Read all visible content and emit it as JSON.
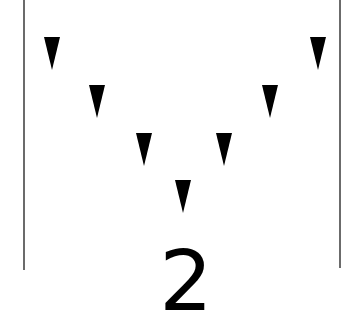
{
  "figure": {
    "label": "2",
    "marker_shape": "downward-triangle",
    "marker_count": 7,
    "marker_color": "#000000",
    "line_color": "#6b6b6b",
    "arrangement": "V"
  }
}
